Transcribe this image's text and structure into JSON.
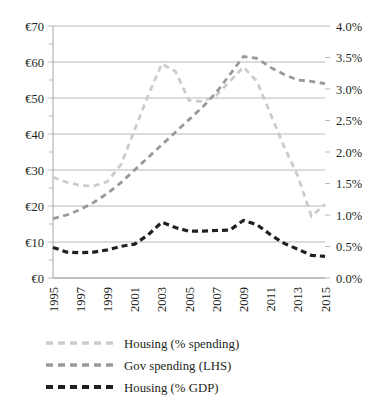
{
  "chart_data": {
    "type": "line",
    "title": "",
    "xlabel": "",
    "ylabel": "",
    "grid": true,
    "legend_position": "bottom",
    "x": [
      1995,
      1996,
      1997,
      1998,
      1999,
      2000,
      2001,
      2002,
      2003,
      2004,
      2005,
      2006,
      2007,
      2008,
      2009,
      2010,
      2011,
      2012,
      2013,
      2014,
      2015
    ],
    "xtick_labels": [
      "1995",
      "1997",
      "1999",
      "2001",
      "2003",
      "2005",
      "2007",
      "2009",
      "2011",
      "2013",
      "2015"
    ],
    "left_axis": {
      "label": "",
      "ylim": [
        0,
        70
      ],
      "tick_step": 10,
      "tick_labels": [
        "€70",
        "€60",
        "€50",
        "€40",
        "€30",
        "€20",
        "€10",
        "€0"
      ],
      "tick_values": [
        70,
        60,
        50,
        40,
        30,
        20,
        10,
        0
      ]
    },
    "right_axis": {
      "label": "",
      "ylim": [
        0.0,
        4.0
      ],
      "tick_step": 0.5,
      "tick_labels": [
        "4.0%",
        "3.5%",
        "3.0%",
        "2.5%",
        "2.0%",
        "1.5%",
        "1.0%",
        "0.5%",
        "0.0%"
      ],
      "tick_values": [
        4.0,
        3.5,
        3.0,
        2.5,
        2.0,
        1.5,
        1.0,
        0.5,
        0.0
      ]
    },
    "series": [
      {
        "name": "Housing (% spending)",
        "axis": "right",
        "color": "#cccccc",
        "style": "dashed",
        "values": [
          1.6,
          1.52,
          1.47,
          1.46,
          1.53,
          1.8,
          2.35,
          2.9,
          3.4,
          3.28,
          2.82,
          2.8,
          2.9,
          3.12,
          3.35,
          3.12,
          2.6,
          2.08,
          1.62,
          0.98,
          1.17
        ],
        "left_equiv": [
          28.0,
          26.6,
          25.7,
          25.6,
          26.8,
          31.5,
          41.1,
          50.8,
          59.5,
          57.4,
          49.4,
          49.0,
          50.8,
          54.6,
          58.6,
          54.6,
          45.5,
          36.4,
          28.4,
          17.2,
          20.5
        ]
      },
      {
        "name": "Gov spending (LHS)",
        "axis": "left",
        "color": "#999999",
        "style": "dashed",
        "values": [
          16.5,
          17.5,
          19.0,
          21.0,
          23.5,
          26.5,
          30.0,
          33.5,
          37.0,
          40.5,
          44.0,
          47.5,
          51.5,
          56.5,
          61.5,
          61.0,
          58.5,
          56.5,
          55.0,
          54.6,
          54.0
        ]
      },
      {
        "name": "Housing (% GDP)",
        "axis": "left",
        "color": "#231f20",
        "style": "dashed",
        "values": [
          8.5,
          7.2,
          7.0,
          7.2,
          7.8,
          8.8,
          9.4,
          12.0,
          15.5,
          14.0,
          13.0,
          13.0,
          13.2,
          13.3,
          16.0,
          14.8,
          12.0,
          9.6,
          8.0,
          6.3,
          6.0
        ],
        "right_equiv": [
          0.49,
          0.41,
          0.4,
          0.41,
          0.45,
          0.5,
          0.54,
          0.69,
          0.89,
          0.8,
          0.74,
          0.74,
          0.75,
          0.76,
          0.91,
          0.85,
          0.69,
          0.55,
          0.46,
          0.36,
          0.34
        ]
      }
    ],
    "legend": [
      {
        "label": "Housing (% spending)",
        "color": "#cccccc"
      },
      {
        "label": "Gov spending (LHS)",
        "color": "#999999"
      },
      {
        "label": "Housing (% GDP)",
        "color": "#231f20"
      }
    ]
  }
}
